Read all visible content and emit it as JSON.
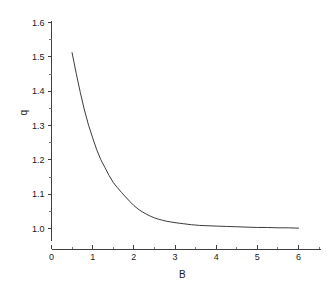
{
  "chart_data": {
    "type": "line",
    "title": "",
    "xlabel": "B",
    "ylabel": "q",
    "xlim": [
      0,
      6.55
    ],
    "ylim": [
      0.965,
      1.605
    ],
    "grid": false,
    "legend": null,
    "x_ticks_major": [
      0,
      1,
      2,
      3,
      4,
      5,
      6
    ],
    "x_ticks_major_labels": [
      "0",
      "1",
      "2",
      "3",
      "4",
      "5",
      "6"
    ],
    "x_ticks_minor": [
      0.5,
      1.5,
      2.5,
      3.5,
      4.5,
      5.5,
      6.5
    ],
    "y_ticks_major": [
      1.0,
      1.1,
      1.2,
      1.3,
      1.4,
      1.5,
      1.6
    ],
    "y_ticks_major_labels": [
      "1.0",
      "1.1",
      "1.2",
      "1.3",
      "1.4",
      "1.5",
      "1.6"
    ],
    "y_ticks_minor": [
      1.05,
      1.15,
      1.25,
      1.35,
      1.45,
      1.55
    ],
    "line_color": "#3c3c3c",
    "axis_color": "#404040",
    "background": "#ffffff",
    "series": [
      {
        "name": "q(B)",
        "x": [
          0.5,
          0.6,
          0.7,
          0.8,
          0.9,
          1.0,
          1.1,
          1.2,
          1.3,
          1.4,
          1.5,
          1.6,
          1.7,
          1.8,
          1.9,
          2.0,
          2.1,
          2.2,
          2.3,
          2.4,
          2.5,
          2.6,
          2.7,
          2.8,
          2.9,
          3.0,
          3.2,
          3.4,
          3.6,
          3.8,
          4.0,
          4.25,
          4.5,
          4.75,
          5.0,
          5.25,
          5.5,
          5.75,
          6.0
        ],
        "y": [
          1.512,
          1.452,
          1.396,
          1.345,
          1.301,
          1.264,
          1.229,
          1.2,
          1.177,
          1.154,
          1.134,
          1.119,
          1.105,
          1.092,
          1.079,
          1.067,
          1.057,
          1.049,
          1.042,
          1.036,
          1.031,
          1.027,
          1.024,
          1.021,
          1.019,
          1.017,
          1.014,
          1.011,
          1.009,
          1.008,
          1.007,
          1.006,
          1.005,
          1.004,
          1.003,
          1.003,
          1.002,
          1.002,
          1.001
        ]
      }
    ]
  }
}
